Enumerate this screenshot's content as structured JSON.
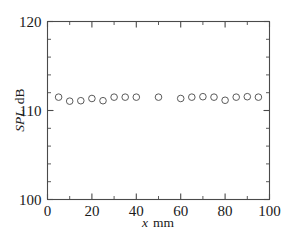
{
  "figure": {
    "background_color": "#ffffff",
    "axis_color": "#4a4a4a",
    "marker_color": "#5a5a5a"
  },
  "chart_data": {
    "type": "scatter",
    "title": "",
    "xlabel": "x  mm",
    "xlabel_italic_part": "x",
    "xlabel_plain_part": "mm",
    "ylabel": "SPL, dB",
    "ylabel_italic_part": "SPL",
    "ylabel_plain_part": "dB",
    "xlim": [
      0,
      100
    ],
    "ylim": [
      100,
      120
    ],
    "xticks": [
      0,
      20,
      40,
      60,
      80,
      100
    ],
    "xtick_labels": [
      "0",
      "20",
      "40",
      "60",
      "80",
      "100"
    ],
    "xticks_minor": [
      10,
      30,
      50,
      70,
      90
    ],
    "yticks": [
      100,
      110,
      120
    ],
    "ytick_labels": [
      "100",
      "110",
      "120"
    ],
    "yticks_minor": [
      102,
      104,
      106,
      108,
      112,
      114,
      116,
      118
    ],
    "grid": false,
    "legend": null,
    "marker": "open-circle",
    "marker_size": 4.6,
    "x": [
      5,
      10,
      15,
      20,
      25,
      30,
      35,
      40,
      50,
      60,
      65,
      70,
      75,
      80,
      85,
      90,
      95
    ],
    "y": [
      111.5,
      111.05,
      111.1,
      111.35,
      111.1,
      111.5,
      111.5,
      111.5,
      111.5,
      111.35,
      111.5,
      111.55,
      111.5,
      111.15,
      111.5,
      111.55,
      111.5
    ],
    "series": [
      {
        "name": "SPL measurement",
        "points": [
          {
            "x": 5,
            "y": 111.5
          },
          {
            "x": 10,
            "y": 111.05
          },
          {
            "x": 15,
            "y": 111.1
          },
          {
            "x": 20,
            "y": 111.35
          },
          {
            "x": 25,
            "y": 111.1
          },
          {
            "x": 30,
            "y": 111.5
          },
          {
            "x": 35,
            "y": 111.5
          },
          {
            "x": 40,
            "y": 111.5
          },
          {
            "x": 50,
            "y": 111.5
          },
          {
            "x": 60,
            "y": 111.35
          },
          {
            "x": 65,
            "y": 111.5
          },
          {
            "x": 70,
            "y": 111.55
          },
          {
            "x": 75,
            "y": 111.5
          },
          {
            "x": 80,
            "y": 111.15
          },
          {
            "x": 85,
            "y": 111.5
          },
          {
            "x": 90,
            "y": 111.55
          },
          {
            "x": 95,
            "y": 111.5
          }
        ]
      }
    ]
  }
}
